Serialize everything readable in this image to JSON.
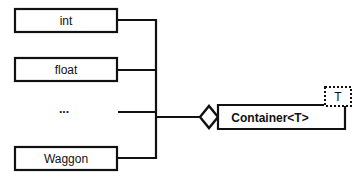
{
  "diagram": {
    "type": "uml-class-aggregation",
    "colors": {
      "stroke": "#111111",
      "background": "#ffffff"
    },
    "parts": [
      {
        "label": "int"
      },
      {
        "label": "float"
      },
      {
        "label": "..."
      },
      {
        "label": "Waggon"
      }
    ],
    "container": {
      "label": "Container<T>",
      "template_parameter": "T",
      "relation": "aggregation-diamond"
    }
  }
}
